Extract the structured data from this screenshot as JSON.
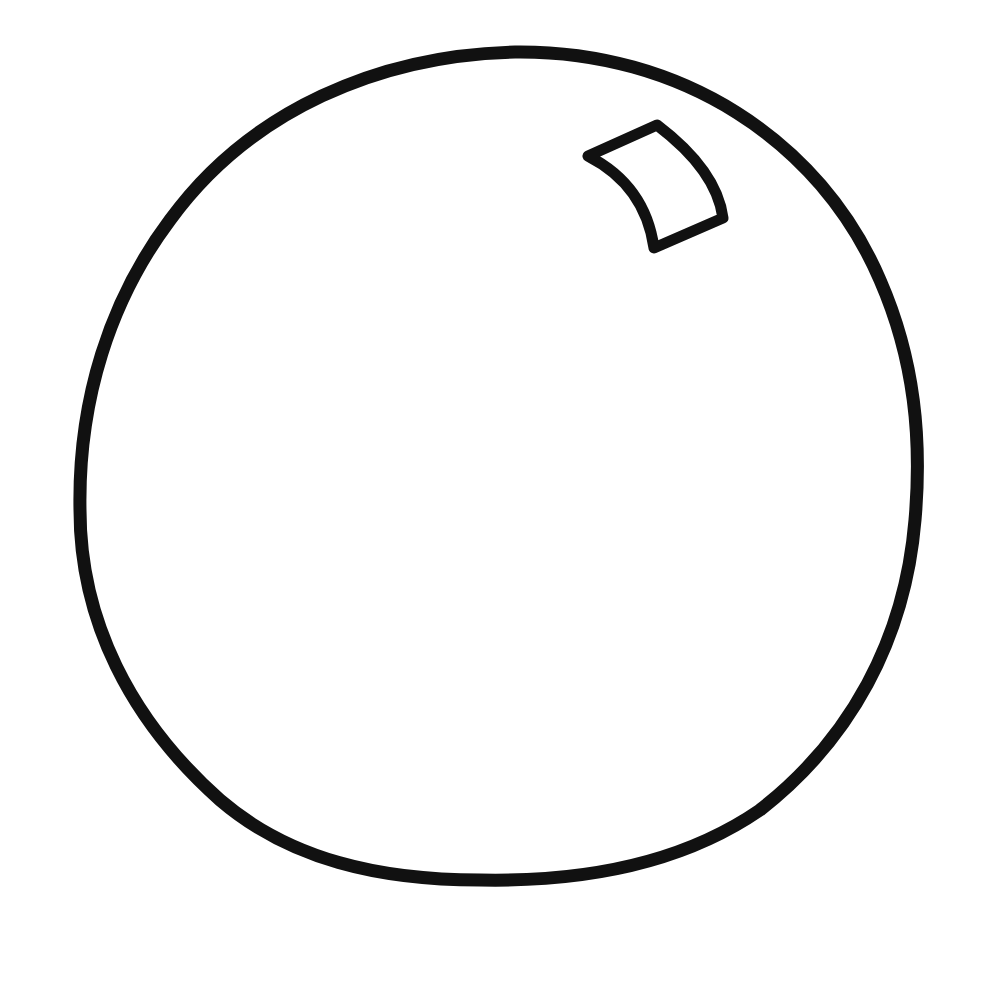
{
  "drawing": {
    "subject": "ball outline with highlight",
    "stroke_color": "#111111",
    "background_color": "#ffffff",
    "shapes": [
      {
        "name": "ball-outline",
        "type": "closed-curve"
      },
      {
        "name": "highlight",
        "type": "curved-quadrilateral"
      }
    ]
  }
}
